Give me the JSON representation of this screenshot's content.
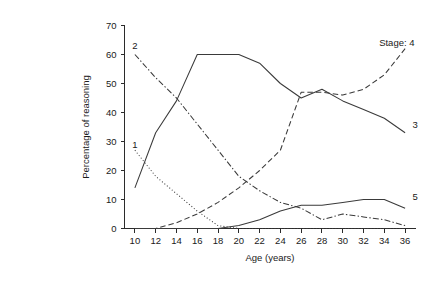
{
  "chart_data": {
    "type": "line",
    "title": "",
    "xlabel": "Age (years)",
    "ylabel": "Percentage of reasoning",
    "xlim": [
      9,
      37
    ],
    "ylim": [
      0,
      70
    ],
    "grid": false,
    "legend_position": "inline-right",
    "x_ticks": [
      10,
      12,
      14,
      16,
      18,
      20,
      22,
      24,
      26,
      28,
      30,
      32,
      34,
      36
    ],
    "y_ticks": [
      0,
      10,
      20,
      30,
      40,
      50,
      60,
      70
    ],
    "x": [
      10,
      12,
      14,
      16,
      18,
      20,
      22,
      24,
      26,
      28,
      30,
      32,
      34,
      36
    ],
    "series": [
      {
        "name": "1",
        "label": "1",
        "line_style": "dotted",
        "label_x": 10,
        "label_y": 29,
        "values": [
          27,
          18,
          12,
          6,
          1,
          0,
          0,
          0,
          0,
          0,
          0,
          0,
          0,
          0
        ]
      },
      {
        "name": "2",
        "label": "2",
        "line_style": "dash-dot",
        "label_x": 10,
        "label_y": 63,
        "values": [
          60,
          52,
          45,
          36,
          27,
          18,
          13,
          9,
          7,
          3,
          5,
          4,
          3,
          1
        ]
      },
      {
        "name": "3",
        "label": "3",
        "line_style": "solid",
        "label_x": 36.7,
        "label_y": 36,
        "values": [
          14,
          33,
          44,
          60,
          60,
          60,
          57,
          50,
          45,
          48,
          44,
          41,
          38,
          33
        ]
      },
      {
        "name": "4",
        "label": "Stage: 4",
        "line_style": "dashed",
        "label_x": 33.5,
        "label_y": 64,
        "values": [
          0,
          0,
          2,
          5,
          9,
          14,
          20,
          27,
          47,
          47,
          46,
          48,
          53,
          62
        ]
      },
      {
        "name": "5",
        "label": "5",
        "line_style": "solid",
        "label_x": 36.7,
        "label_y": 11,
        "values": [
          0,
          0,
          0,
          0,
          0,
          1,
          3,
          6,
          8,
          8,
          9,
          10,
          10,
          7
        ]
      }
    ]
  },
  "axes": {
    "x_title": "Age (years)",
    "y_title": "Percentage of reasoning"
  }
}
